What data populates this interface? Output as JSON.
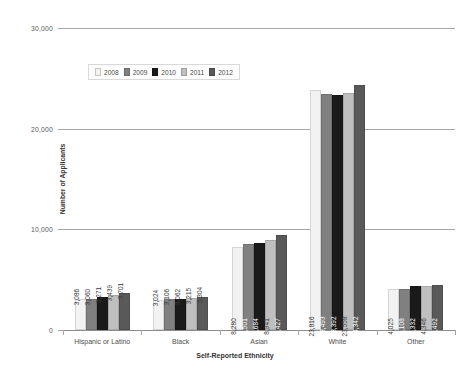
{
  "chart_data": {
    "type": "bar",
    "title": "",
    "xlabel": "Self-Reported Ethnicity",
    "ylabel": "Number of Applicants",
    "ylim": [
      0,
      30000
    ],
    "yticks": [
      0,
      10000,
      20000,
      30000
    ],
    "ytick_labels": [
      "0",
      "10,000",
      "20,000",
      "30,000"
    ],
    "grid": true,
    "legend_position": "upper-left-inside",
    "categories": [
      "Hispanic or Latino",
      "Black",
      "Asian",
      "White",
      "Other"
    ],
    "series": [
      {
        "name": "2008",
        "color": "#f2f2f2",
        "values": [
          3086,
          3024,
          8280,
          23816,
          4025
        ],
        "labels": [
          "3,086",
          "3,024",
          "8,280",
          "23,816",
          "4,025"
        ]
      },
      {
        "name": "2009",
        "color": "#808080",
        "values": [
          3060,
          3106,
          8501,
          23493,
          4108
        ],
        "labels": [
          "3,060",
          "3,106",
          "8,501",
          "23,493",
          "4,108"
        ]
      },
      {
        "name": "2010",
        "color": "#1a1a1a",
        "values": [
          3271,
          3062,
          8684,
          23392,
          4332
        ],
        "labels": [
          "3,271",
          "3,062",
          "8,684",
          "23,392",
          "4,332"
        ]
      },
      {
        "name": "2011",
        "color": "#bfbfbf",
        "values": [
          3439,
          3215,
          8941,
          23558,
          4346
        ],
        "labels": [
          "3,439",
          "3,215",
          "8,941",
          "23,558",
          "4,346"
        ]
      },
      {
        "name": "2012",
        "color": "#595959",
        "values": [
          3701,
          3304,
          9427,
          24342,
          4492
        ],
        "labels": [
          "3,701",
          "3,304",
          "9,427",
          "24,342",
          "4,492"
        ]
      }
    ]
  }
}
